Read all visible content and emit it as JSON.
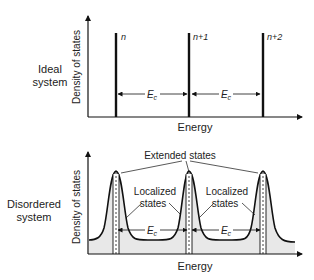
{
  "top_panel": {
    "system_label_line1": "Ideal",
    "system_label_line2": "system",
    "y_axis_label": "Density of states",
    "x_axis_label": "Energy",
    "level_labels": [
      "n",
      "n+1",
      "n+2"
    ],
    "spacing_label": "E",
    "spacing_subscript": "c"
  },
  "bottom_panel": {
    "system_label_line1": "Disordered",
    "system_label_line2": "system",
    "y_axis_label": "Density of states",
    "x_axis_label": "Energy",
    "extended_label": "Extended states",
    "localized_label_line1": "Localized",
    "localized_label_line2": "states",
    "spacing_label": "E",
    "spacing_subscript": "c"
  },
  "colors": {
    "line": "#111111",
    "fill": "#e6e6e6",
    "text": "#222222"
  }
}
